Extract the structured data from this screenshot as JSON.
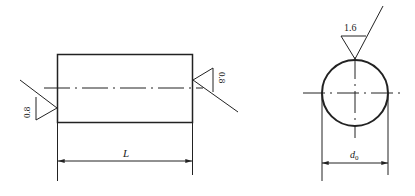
{
  "diagram": {
    "title": "",
    "left_view": {
      "shape": "rectangle",
      "roughness_left": "0.8",
      "roughness_right": "0.8",
      "dimension_label": "L"
    },
    "right_view": {
      "shape": "circle",
      "roughness_top": "1.6",
      "dimension_label_main": "d",
      "dimension_label_sub": "0"
    },
    "colors": {
      "line": "#222222",
      "background": "#ffffff"
    }
  }
}
